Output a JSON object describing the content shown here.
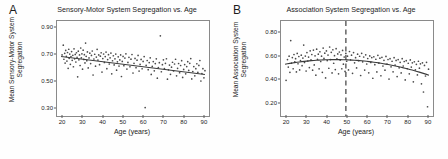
{
  "figure": {
    "background": "#fefefe",
    "point_color": "#4a4a4a",
    "line_color": "#3a3a3a",
    "frame_color": "#8a8a8a",
    "dashed_color": "#6f6f6f"
  },
  "panels": [
    {
      "letter": "A",
      "title": "Sensory-Motor System Segregation vs. Age",
      "ylabel_line1": "Mean Sensory-Motor System",
      "ylabel_line2": "Segregation",
      "xlabel": "Age (years)"
    },
    {
      "letter": "B",
      "title": "Association System Segregation vs. Age",
      "ylabel_line1": "Mean Association System",
      "ylabel_line2": "Segregation",
      "xlabel": "Age (years)"
    }
  ],
  "chart_data": [
    {
      "type": "scatter",
      "panel": "A",
      "title": "Sensory-Motor System Segregation vs. Age",
      "xlabel": "Age (years)",
      "ylabel": "Mean Sensory-Motor System Segregation",
      "xlim": [
        17,
        92
      ],
      "ylim": [
        0.25,
        0.95
      ],
      "xticks": [
        20,
        30,
        40,
        50,
        60,
        70,
        80,
        90
      ],
      "xticklabels": [
        "20",
        "30",
        "40",
        "50",
        "60",
        "70",
        "80",
        "90"
      ],
      "yticks": [
        0.3,
        0.5,
        0.7,
        0.9
      ],
      "yticklabels": [
        "0.30",
        "0.50",
        "0.70",
        "0.90"
      ],
      "grid": false,
      "legend": "none",
      "fit": {
        "kind": "linear",
        "x": [
          19,
          90
        ],
        "y": [
          0.688,
          0.556
        ],
        "slope": -0.00186,
        "intercept": 0.723
      },
      "x": [
        19.5,
        20.1,
        20.4,
        20.8,
        21.0,
        21.3,
        21.6,
        21.9,
        22.2,
        22.5,
        22.8,
        23.0,
        23.3,
        23.6,
        23.9,
        24.2,
        24.5,
        24.8,
        25.1,
        25.4,
        25.7,
        26.0,
        26.3,
        26.6,
        26.9,
        27.2,
        27.5,
        27.8,
        28.1,
        28.4,
        28.7,
        29.0,
        29.3,
        29.6,
        29.9,
        30.2,
        30.5,
        30.8,
        31.1,
        31.4,
        31.7,
        32.0,
        32.4,
        32.8,
        33.2,
        33.6,
        34.0,
        34.4,
        34.8,
        35.2,
        35.6,
        36.0,
        36.4,
        36.8,
        37.2,
        37.6,
        38.0,
        38.4,
        38.8,
        39.2,
        39.6,
        40.0,
        40.4,
        40.8,
        41.2,
        41.6,
        42.0,
        42.4,
        42.8,
        43.2,
        43.6,
        44.0,
        44.4,
        44.8,
        45.2,
        45.6,
        46.0,
        46.4,
        46.8,
        47.2,
        47.6,
        48.0,
        48.4,
        48.8,
        49.2,
        49.6,
        50.0,
        50.5,
        51.0,
        51.5,
        52.0,
        52.5,
        53.0,
        53.5,
        54.0,
        54.5,
        55.0,
        55.5,
        56.0,
        56.5,
        57.0,
        57.5,
        58.0,
        58.5,
        59.0,
        59.5,
        60.0,
        60.5,
        61.0,
        61.5,
        62.0,
        62.5,
        63.0,
        63.5,
        64.0,
        64.5,
        65.0,
        65.5,
        66.0,
        66.5,
        67.0,
        67.5,
        68.0,
        68.5,
        69.0,
        69.5,
        70.0,
        70.5,
        71.0,
        71.5,
        72.0,
        72.5,
        73.0,
        73.5,
        74.0,
        74.5,
        75.0,
        75.5,
        76.0,
        76.5,
        77.0,
        77.5,
        78.0,
        78.5,
        79.0,
        79.5,
        80.0,
        80.5,
        81.0,
        81.5,
        82.0,
        82.5,
        83.0,
        83.5,
        84.0,
        84.5,
        85.0,
        85.5,
        86.0,
        86.5,
        87.0,
        87.5,
        88.0,
        88.5,
        89.0,
        89.5,
        90.0
      ],
      "y": [
        0.7,
        0.772,
        0.668,
        0.712,
        0.64,
        0.733,
        0.69,
        0.655,
        0.718,
        0.601,
        0.742,
        0.675,
        0.706,
        0.631,
        0.688,
        0.725,
        0.66,
        0.697,
        0.613,
        0.745,
        0.671,
        0.704,
        0.648,
        0.716,
        0.683,
        0.539,
        0.728,
        0.664,
        0.7,
        0.622,
        0.751,
        0.679,
        0.708,
        0.595,
        0.735,
        0.667,
        0.702,
        0.641,
        0.787,
        0.69,
        0.658,
        0.722,
        0.604,
        0.678,
        0.713,
        0.636,
        0.696,
        0.729,
        0.552,
        0.67,
        0.705,
        0.617,
        0.684,
        0.741,
        0.662,
        0.7,
        0.628,
        0.691,
        0.716,
        0.574,
        0.673,
        0.707,
        0.645,
        0.688,
        0.721,
        0.599,
        0.666,
        0.702,
        0.633,
        0.679,
        0.714,
        0.561,
        0.657,
        0.694,
        0.626,
        0.671,
        0.706,
        0.588,
        0.649,
        0.686,
        0.618,
        0.663,
        0.7,
        0.541,
        0.652,
        0.689,
        0.621,
        0.677,
        0.708,
        0.596,
        0.645,
        0.682,
        0.613,
        0.669,
        0.703,
        0.567,
        0.638,
        0.674,
        0.606,
        0.661,
        0.696,
        0.581,
        0.63,
        0.667,
        0.598,
        0.652,
        0.688,
        0.312,
        0.623,
        0.659,
        0.591,
        0.644,
        0.679,
        0.556,
        0.615,
        0.651,
        0.583,
        0.636,
        0.671,
        0.529,
        0.607,
        0.643,
        0.841,
        0.576,
        0.628,
        0.664,
        0.599,
        0.638,
        0.672,
        0.521,
        0.59,
        0.625,
        0.557,
        0.61,
        0.646,
        0.582,
        0.633,
        0.668,
        0.546,
        0.601,
        0.637,
        0.569,
        0.622,
        0.658,
        0.534,
        0.593,
        0.629,
        0.561,
        0.614,
        0.65,
        0.586,
        0.638,
        0.673,
        0.523,
        0.578,
        0.614,
        0.546,
        0.599,
        0.635,
        0.571,
        0.623,
        0.659,
        0.508,
        0.563,
        0.599,
        0.531,
        0.584,
        0.62,
        0.556,
        0.608,
        0.644,
        0.57,
        0.592,
        0.556
      ]
    },
    {
      "type": "scatter",
      "panel": "B",
      "title": "Association System Segregation vs. Age",
      "xlabel": "Age (years)",
      "ylabel": "Mean Association System Segregation",
      "xlim": [
        17,
        92
      ],
      "ylim": [
        0.1,
        0.9
      ],
      "xticks": [
        20,
        30,
        40,
        50,
        60,
        70,
        80,
        90
      ],
      "xticklabels": [
        "20",
        "30",
        "40",
        "50",
        "60",
        "70",
        "80",
        "90"
      ],
      "yticks": [
        0.2,
        0.4,
        0.6,
        0.8
      ],
      "yticklabels": [
        "0.20",
        "0.40",
        "0.60",
        "0.80"
      ],
      "grid": false,
      "legend": "none",
      "annotation": {
        "type": "vertical-dashed-line",
        "x": 49,
        "label": "inflection point"
      },
      "fit": {
        "kind": "quadratic",
        "vertex_x": 44,
        "vertex_y": 0.575,
        "a": -6.2e-05,
        "x_range": [
          19,
          90
        ]
      },
      "x": [
        19.5,
        20.2,
        20.6,
        21.0,
        21.4,
        21.8,
        22.2,
        22.6,
        23.0,
        23.4,
        23.8,
        24.2,
        24.6,
        25.0,
        25.4,
        25.8,
        26.2,
        26.6,
        27.0,
        27.4,
        27.8,
        28.2,
        28.6,
        29.0,
        29.4,
        29.8,
        30.2,
        30.6,
        31.0,
        31.4,
        31.8,
        32.2,
        32.6,
        33.0,
        33.4,
        33.8,
        34.2,
        34.6,
        35.0,
        35.4,
        35.8,
        36.2,
        36.6,
        37.0,
        37.4,
        37.8,
        38.2,
        38.6,
        39.0,
        39.4,
        39.8,
        40.2,
        40.6,
        41.0,
        41.4,
        41.8,
        42.2,
        42.6,
        43.0,
        43.4,
        43.8,
        44.2,
        44.6,
        45.0,
        45.4,
        45.8,
        46.2,
        46.6,
        47.0,
        47.4,
        47.8,
        48.2,
        48.6,
        49.0,
        49.4,
        49.8,
        50.3,
        50.8,
        51.3,
        51.8,
        52.3,
        52.8,
        53.3,
        53.8,
        54.3,
        54.8,
        55.3,
        55.8,
        56.3,
        56.8,
        57.3,
        57.8,
        58.3,
        58.8,
        59.3,
        59.8,
        60.3,
        60.8,
        61.3,
        61.8,
        62.3,
        62.8,
        63.3,
        63.8,
        64.3,
        64.8,
        65.3,
        65.8,
        66.3,
        66.8,
        67.3,
        67.8,
        68.3,
        68.8,
        69.3,
        69.8,
        70.3,
        70.8,
        71.3,
        71.8,
        72.3,
        72.8,
        73.3,
        73.8,
        74.3,
        74.8,
        75.3,
        75.8,
        76.3,
        76.8,
        77.3,
        77.8,
        78.3,
        78.8,
        79.3,
        79.8,
        80.3,
        80.8,
        81.3,
        81.8,
        82.3,
        82.8,
        83.3,
        83.8,
        84.3,
        84.8,
        85.3,
        85.8,
        86.3,
        86.8,
        87.3,
        87.8,
        88.3,
        88.8,
        89.3,
        89.8
      ],
      "y": [
        0.4,
        0.575,
        0.512,
        0.604,
        0.468,
        0.735,
        0.545,
        0.592,
        0.498,
        0.618,
        0.556,
        0.583,
        0.471,
        0.627,
        0.54,
        0.601,
        0.488,
        0.566,
        0.612,
        0.524,
        0.588,
        0.697,
        0.551,
        0.605,
        0.479,
        0.634,
        0.563,
        0.596,
        0.508,
        0.649,
        0.572,
        0.618,
        0.486,
        0.655,
        0.53,
        0.607,
        0.444,
        0.663,
        0.578,
        0.621,
        0.497,
        0.641,
        0.559,
        0.604,
        0.468,
        0.672,
        0.585,
        0.629,
        0.421,
        0.648,
        0.567,
        0.613,
        0.502,
        0.681,
        0.575,
        0.636,
        0.463,
        0.658,
        0.544,
        0.608,
        0.491,
        0.667,
        0.582,
        0.623,
        0.455,
        0.639,
        0.571,
        0.615,
        0.498,
        0.652,
        0.536,
        0.597,
        0.475,
        0.627,
        0.561,
        0.604,
        0.488,
        0.643,
        0.572,
        0.612,
        0.459,
        0.634,
        0.548,
        0.591,
        0.505,
        0.621,
        0.566,
        0.603,
        0.441,
        0.628,
        0.556,
        0.597,
        0.487,
        0.615,
        0.538,
        0.584,
        0.464,
        0.606,
        0.551,
        0.592,
        0.418,
        0.599,
        0.532,
        0.578,
        0.471,
        0.611,
        0.546,
        0.587,
        0.439,
        0.594,
        0.521,
        0.569,
        0.486,
        0.602,
        0.538,
        0.576,
        0.411,
        0.583,
        0.514,
        0.561,
        0.472,
        0.591,
        0.529,
        0.568,
        0.432,
        0.575,
        0.506,
        0.552,
        0.463,
        0.583,
        0.521,
        0.559,
        0.404,
        0.566,
        0.498,
        0.544,
        0.455,
        0.572,
        0.512,
        0.548,
        0.388,
        0.557,
        0.489,
        0.535,
        0.446,
        0.561,
        0.503,
        0.539,
        0.371,
        0.548,
        0.302,
        0.526,
        0.437,
        0.552,
        0.178,
        0.494,
        0.529,
        0.418
      ]
    }
  ]
}
